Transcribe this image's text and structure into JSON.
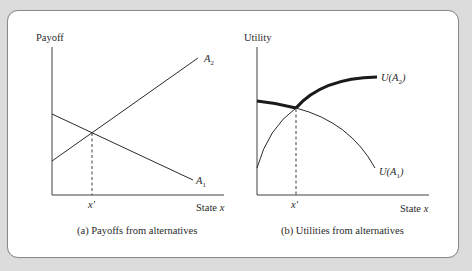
{
  "figure": {
    "panel_a": {
      "ylabel": "Payoff",
      "xlabel": "State x",
      "xlabel_prefix": "State ",
      "xlabel_var": "x",
      "xtick": "x′",
      "caption": "(a) Payoffs from alternatives",
      "line_labels": [
        {
          "base": "A",
          "sub": "2"
        },
        {
          "base": "A",
          "sub": "1"
        }
      ]
    },
    "panel_b": {
      "ylabel": "Utility",
      "xlabel": "State x",
      "xlabel_prefix": "State ",
      "xlabel_var": "x",
      "xtick": "x′",
      "caption": "(b) Utilities from alternatives",
      "curve_labels": [
        {
          "pre": "U(",
          "base": "A",
          "sub": "2",
          "post": ")"
        },
        {
          "pre": "U(",
          "base": "A",
          "sub": "1",
          "post": ")"
        }
      ]
    }
  },
  "colors": {
    "background": "#dcdcdc",
    "panel": "#ffffff",
    "ink": "#2a2a2a"
  }
}
